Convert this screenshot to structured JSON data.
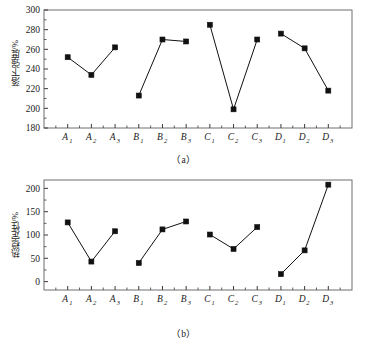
{
  "figure": {
    "panels": [
      {
        "caption": "（a）",
        "ylabel": "落下强度/%",
        "xlabel": ""
      },
      {
        "caption": "（b）",
        "ylabel": "热稳定性/%",
        "xlabel": ""
      }
    ]
  },
  "chart_data": [
    {
      "type": "line",
      "title": "",
      "caption": "（a）",
      "xlabel": "",
      "ylabel": "落下强度/%",
      "categories": [
        "A1",
        "A2",
        "A3",
        "B1",
        "B2",
        "B3",
        "C1",
        "C2",
        "C3",
        "D1",
        "D2",
        "D3"
      ],
      "category_labels": [
        {
          "base": "A",
          "sub": "1"
        },
        {
          "base": "A",
          "sub": "2"
        },
        {
          "base": "A",
          "sub": "3"
        },
        {
          "base": "B",
          "sub": "1"
        },
        {
          "base": "B",
          "sub": "2"
        },
        {
          "base": "B",
          "sub": "3"
        },
        {
          "base": "C",
          "sub": "1"
        },
        {
          "base": "C",
          "sub": "2"
        },
        {
          "base": "C",
          "sub": "3"
        },
        {
          "base": "D",
          "sub": "1"
        },
        {
          "base": "D",
          "sub": "2"
        },
        {
          "base": "D",
          "sub": "3"
        }
      ],
      "values": [
        252,
        234,
        262,
        213,
        270,
        268,
        285,
        199,
        270,
        276,
        261,
        218
      ],
      "segments": [
        [
          0,
          1,
          2
        ],
        [
          3,
          4,
          5
        ],
        [
          6,
          7,
          8
        ],
        [
          9,
          10,
          11
        ]
      ],
      "ylim": [
        180,
        300
      ],
      "yticks": [
        180,
        200,
        220,
        240,
        260,
        280,
        300
      ],
      "ytick_labels": [
        "180",
        "200",
        "220",
        "240",
        "260",
        "280",
        "300"
      ],
      "grid": false,
      "legend": null,
      "marker": "filled-square",
      "marker_color": "#111111",
      "line_color": "#111111"
    },
    {
      "type": "line",
      "title": "",
      "caption": "（b）",
      "xlabel": "",
      "ylabel": "热稳定性/%",
      "categories": [
        "A1",
        "A2",
        "A3",
        "B1",
        "B2",
        "B3",
        "C1",
        "C2",
        "C3",
        "D1",
        "D2",
        "D3"
      ],
      "category_labels": [
        {
          "base": "A",
          "sub": "1"
        },
        {
          "base": "A",
          "sub": "2"
        },
        {
          "base": "A",
          "sub": "3"
        },
        {
          "base": "B",
          "sub": "1"
        },
        {
          "base": "B",
          "sub": "2"
        },
        {
          "base": "B",
          "sub": "3"
        },
        {
          "base": "C",
          "sub": "1"
        },
        {
          "base": "C",
          "sub": "2"
        },
        {
          "base": "C",
          "sub": "3"
        },
        {
          "base": "D",
          "sub": "1"
        },
        {
          "base": "D",
          "sub": "2"
        },
        {
          "base": "D",
          "sub": "3"
        }
      ],
      "values": [
        127,
        43,
        108,
        40,
        112,
        129,
        101,
        70,
        117,
        16,
        67,
        208
      ],
      "segments": [
        [
          0,
          1,
          2
        ],
        [
          3,
          4,
          5
        ],
        [
          6,
          7,
          8
        ],
        [
          9,
          10,
          11
        ]
      ],
      "ylim": [
        -18,
        218
      ],
      "yticks": [
        0,
        50,
        100,
        150,
        200
      ],
      "ytick_labels": [
        "0",
        "50",
        "100",
        "150",
        "200"
      ],
      "grid": false,
      "legend": null,
      "marker": "filled-square",
      "marker_color": "#111111",
      "line_color": "#111111"
    }
  ]
}
